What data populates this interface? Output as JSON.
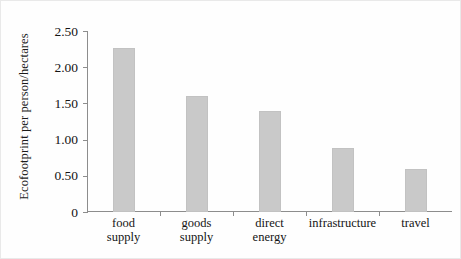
{
  "chart_data": {
    "type": "bar",
    "title": "",
    "xlabel": "",
    "ylabel": "Ecofootprint per person/hectares",
    "categories": [
      "food\nsupply",
      "goods\nsupply",
      "direct\nenergy",
      "infrastructure",
      "travel"
    ],
    "values": [
      2.27,
      1.6,
      1.39,
      0.88,
      0.59
    ],
    "ylim": [
      0,
      2.5
    ],
    "yticks": [
      0,
      0.5,
      1.0,
      1.5,
      2.0,
      2.5
    ],
    "ytick_labels": [
      "0",
      "0.50",
      "1.00",
      "1.50",
      "2.00",
      "2.50"
    ],
    "grid": false,
    "legend": null,
    "bar_color": "#c9c9c9",
    "axis_color": "#8d8d8d",
    "text_color": "#141414",
    "background": "#fefefe"
  }
}
